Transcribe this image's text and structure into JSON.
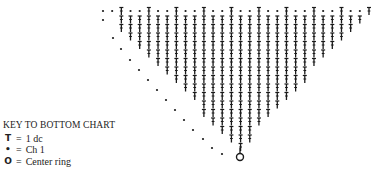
{
  "key": {
    "title": "KEY TO BOTTOM CHART",
    "items": [
      {
        "symbol": "T",
        "icon": "double-crochet-icon",
        "equals": "=",
        "label": "1 dc"
      },
      {
        "symbol": "•",
        "icon": "chain-dot-icon",
        "equals": "=",
        "label": "Ch 1"
      },
      {
        "symbol": "O",
        "icon": "center-ring-icon",
        "equals": "=",
        "label": "Center ring"
      }
    ]
  },
  "chart": {
    "ink_color": "#1a1a1a",
    "center_ring": {
      "x": 240,
      "y": 157,
      "r": 3.5
    },
    "top_row_y": 11,
    "row_pitch": 8.5,
    "top_row_x_start": 103,
    "top_row_x_end": 369,
    "column_pitch": 9.1,
    "left_edge_dots": [
      [
        103,
        20
      ],
      [
        113,
        38
      ],
      [
        121,
        49
      ],
      [
        130,
        60
      ],
      [
        139,
        70
      ],
      [
        148,
        80
      ],
      [
        157,
        90
      ],
      [
        166,
        100
      ],
      [
        175,
        110
      ],
      [
        184,
        120
      ],
      [
        193,
        130
      ],
      [
        203,
        139
      ],
      [
        212,
        148
      ],
      [
        222,
        154
      ]
    ]
  }
}
